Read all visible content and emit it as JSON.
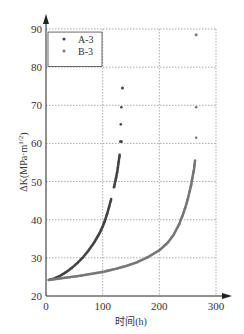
{
  "chart_data": {
    "type": "scatter",
    "title": "",
    "xlabel": "时间(h)",
    "ylabel": "ΔK(MPa·m^1/2)",
    "xlim": [
      0,
      300
    ],
    "ylim": [
      20,
      90
    ],
    "xticks": [
      0,
      100,
      200,
      300
    ],
    "yticks": [
      20,
      30,
      40,
      50,
      60,
      70,
      80,
      90
    ],
    "grid": true,
    "legend_position": "upper left",
    "series": [
      {
        "name": "A-3",
        "color": "#444444",
        "x": [
          5,
          15,
          25,
          35,
          45,
          55,
          65,
          75,
          85,
          95,
          100,
          105,
          110,
          115,
          120,
          123,
          126,
          128,
          130,
          131,
          132,
          133,
          135,
          133
        ],
        "y": [
          24.2,
          24.6,
          25.3,
          26.2,
          27.3,
          28.6,
          30.1,
          31.9,
          34.0,
          36.6,
          38.2,
          40.2,
          42.6,
          45.4,
          48.5,
          50.5,
          52.8,
          55.0,
          57.0,
          60.5,
          65.0,
          69.5,
          74.5,
          60.5
        ]
      },
      {
        "name": "B-3",
        "color": "#777777",
        "x": [
          5,
          20,
          40,
          60,
          80,
          100,
          120,
          140,
          160,
          180,
          200,
          215,
          225,
          235,
          242,
          248,
          252,
          256,
          259,
          261,
          263,
          265,
          265,
          265
        ],
        "y": [
          24.2,
          24.5,
          24.9,
          25.3,
          25.8,
          26.3,
          27.0,
          27.8,
          28.8,
          30.2,
          32.0,
          34.0,
          36.0,
          38.8,
          41.5,
          44.2,
          46.5,
          49.0,
          51.5,
          53.0,
          55.5,
          61.5,
          69.5,
          88.5
        ]
      }
    ]
  }
}
